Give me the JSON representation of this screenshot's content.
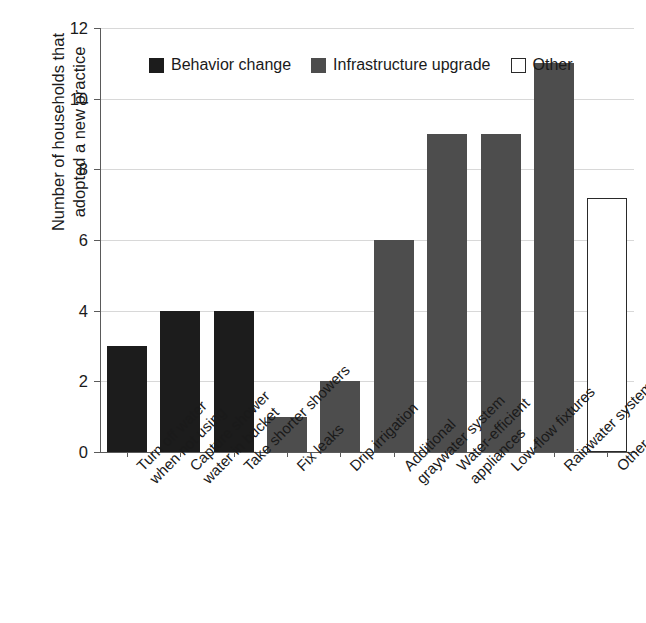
{
  "chart_data": {
    "type": "bar",
    "title": "",
    "xlabel": "",
    "ylabel": "Number of households that adopted a new practice",
    "ylabel_lines": [
      "Number of households that",
      "adopted a new practice"
    ],
    "ylim": [
      0,
      12
    ],
    "ytick_values": [
      0,
      2,
      4,
      6,
      8,
      10,
      12
    ],
    "ytick_labels": [
      "0",
      "2",
      "4",
      "6",
      "8",
      "10",
      "12"
    ],
    "grid": true,
    "grid_axis": "y",
    "legend_position": "upper left inside",
    "categories": [
      "Turn off water when not using",
      "Capture shower water in bucket",
      "Take shorter showers",
      "Fix leaks",
      "Drip irrigation",
      "Additional graywater system",
      "Water-efficient appliances",
      "Low-flow fixtures",
      "Rainwater system",
      "Other"
    ],
    "category_label_lines": [
      [
        "Turn off water",
        "when not using"
      ],
      [
        "Capture shower",
        "water in bucket"
      ],
      [
        "Take shorter showers"
      ],
      [
        "Fix leaks"
      ],
      [
        "Drip irrigation"
      ],
      [
        "Additional",
        "graywater system"
      ],
      [
        "Water-efficient",
        "appliances"
      ],
      [
        "Low-flow fixtures"
      ],
      [
        "Rainwater system"
      ],
      [
        "Other"
      ]
    ],
    "values": [
      3,
      4,
      4,
      1,
      2,
      6,
      9,
      9,
      11,
      7.2
    ],
    "groups": [
      "behavior",
      "behavior",
      "behavior",
      "infra",
      "infra",
      "infra",
      "infra",
      "infra",
      "infra",
      "other"
    ]
  },
  "legend": {
    "items": [
      {
        "label": "Behavior change",
        "key": "behavior",
        "color": "#1c1c1c"
      },
      {
        "label": "Infrastructure upgrade",
        "key": "infra",
        "color": "#4d4d4d"
      },
      {
        "label": "Other",
        "key": "other",
        "color": "#ffffff"
      }
    ]
  },
  "colors": {
    "behavior_change": "#1c1c1c",
    "infrastructure_upgrade": "#4d4d4d",
    "other_fill": "#ffffff",
    "other_stroke": "#2a2a2a",
    "axis": "#5a5a5a",
    "grid": "#d8d8d8",
    "text": "#1a1a1a",
    "background": "#ffffff"
  }
}
